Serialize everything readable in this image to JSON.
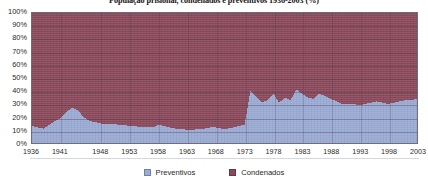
{
  "chart_data": {
    "type": "area",
    "stacked": true,
    "stack_total": 100,
    "title": "População prisional, condenados e preventivos 1936-2003 (%)",
    "xlabel": "",
    "ylabel": "",
    "ylim": [
      0,
      100
    ],
    "xlim": [
      1936,
      2003
    ],
    "grid": true,
    "legend_position": "bottom",
    "y_ticks": [
      "0%",
      "10%",
      "20%",
      "30%",
      "40%",
      "50%",
      "60%",
      "70%",
      "80%",
      "90%",
      "100%"
    ],
    "y_tick_values": [
      0,
      10,
      20,
      30,
      40,
      50,
      60,
      70,
      80,
      90,
      100
    ],
    "x_ticks": [
      "1936",
      "1941",
      "1948",
      "1953",
      "1958",
      "1963",
      "1968",
      "1973",
      "1978",
      "1983",
      "1988",
      "1993",
      "1998",
      "2003"
    ],
    "x_tick_values": [
      1936,
      1941,
      1948,
      1953,
      1958,
      1963,
      1968,
      1973,
      1978,
      1983,
      1988,
      1993,
      1998,
      2003
    ],
    "x": [
      1936,
      1937,
      1938,
      1939,
      1940,
      1941,
      1942,
      1943,
      1944,
      1945,
      1946,
      1947,
      1948,
      1949,
      1950,
      1951,
      1952,
      1953,
      1954,
      1955,
      1956,
      1957,
      1958,
      1959,
      1960,
      1961,
      1962,
      1963,
      1964,
      1965,
      1966,
      1967,
      1968,
      1969,
      1970,
      1971,
      1972,
      1973,
      1974,
      1975,
      1976,
      1977,
      1978,
      1979,
      1980,
      1981,
      1982,
      1983,
      1984,
      1985,
      1986,
      1987,
      1988,
      1989,
      1990,
      1991,
      1992,
      1993,
      1994,
      1995,
      1996,
      1997,
      1998,
      1999,
      2000,
      2001,
      2002,
      2003
    ],
    "series": [
      {
        "name": "Preventivos",
        "color": "#9aabd4",
        "values": [
          13,
          12,
          11,
          14,
          17,
          19,
          24,
          27,
          25,
          20,
          17,
          16,
          15,
          15,
          15,
          14,
          14,
          13,
          13,
          12,
          12,
          12,
          14,
          13,
          12,
          11,
          11,
          10,
          10,
          11,
          11,
          12,
          12,
          11,
          11,
          12,
          13,
          14,
          40,
          36,
          31,
          33,
          38,
          31,
          35,
          33,
          41,
          38,
          35,
          34,
          38,
          36,
          34,
          32,
          30,
          30,
          30,
          29,
          30,
          31,
          32,
          31,
          30,
          31,
          32,
          33,
          33,
          34
        ]
      },
      {
        "name": "Condenados",
        "color": "#8b4a5c",
        "values": [
          87,
          88,
          89,
          86,
          83,
          81,
          76,
          73,
          75,
          80,
          83,
          84,
          85,
          85,
          85,
          86,
          86,
          87,
          87,
          88,
          88,
          88,
          86,
          87,
          88,
          89,
          89,
          90,
          90,
          89,
          89,
          88,
          88,
          89,
          89,
          88,
          87,
          86,
          60,
          64,
          69,
          67,
          62,
          69,
          65,
          67,
          59,
          62,
          65,
          66,
          62,
          64,
          66,
          68,
          70,
          70,
          70,
          71,
          70,
          69,
          68,
          69,
          70,
          69,
          68,
          67,
          67,
          66
        ]
      }
    ]
  },
  "legend": {
    "items": [
      {
        "label": "Preventivos",
        "color": "#9aabd4"
      },
      {
        "label": "Condenados",
        "color": "#8b4a5c"
      }
    ]
  }
}
